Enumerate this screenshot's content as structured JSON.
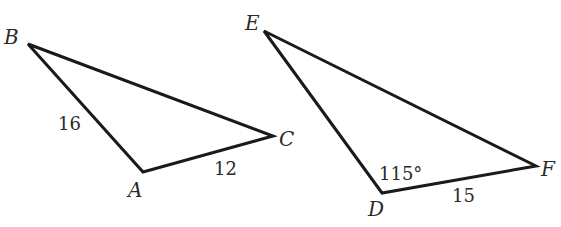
{
  "diagram": {
    "type": "geometry-triangles",
    "stroke_color": "#1a1a1a",
    "text_color": "#2a2a2a",
    "triangles": [
      {
        "name": "ABC",
        "vertices": {
          "A": {
            "label": "A",
            "x": 143,
            "y": 172
          },
          "B": {
            "label": "B",
            "x": 28,
            "y": 44
          },
          "C": {
            "label": "C",
            "x": 273,
            "y": 136
          }
        },
        "measures": {
          "AB": "16",
          "AC": "12"
        }
      },
      {
        "name": "DEF",
        "vertices": {
          "D": {
            "label": "D",
            "x": 382,
            "y": 193
          },
          "E": {
            "label": "E",
            "x": 264,
            "y": 31
          },
          "F": {
            "label": "F",
            "x": 536,
            "y": 166
          }
        },
        "measures": {
          "angle_D": "115°",
          "DF": "15"
        }
      }
    ]
  }
}
